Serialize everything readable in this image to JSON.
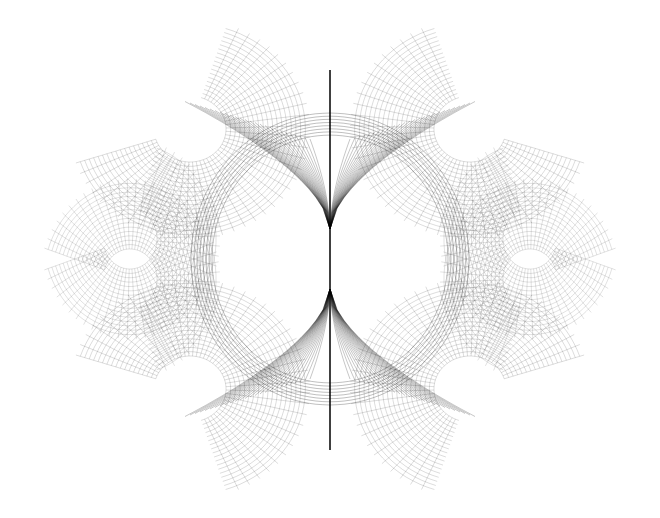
{
  "image": {
    "description": "Black wireframe rendering of a symmetric mathematical surface on white background",
    "background": "#ffffff",
    "stroke": "#000000",
    "width": 660,
    "height": 518
  }
}
